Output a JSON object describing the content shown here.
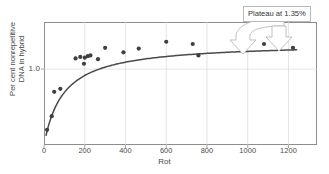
{
  "chart_data": {
    "type": "scatter",
    "title": "",
    "xlabel": "Rot",
    "ylabel_lines": [
      "Per cent nonrepetitive",
      "DNA in hybrid"
    ],
    "xlim": [
      0,
      1340
    ],
    "ylim": [
      0,
      1.62
    ],
    "xticks": [
      0,
      200,
      400,
      600,
      800,
      1000,
      1200
    ],
    "xticklabels": [
      "0",
      "200",
      "400",
      "600",
      "800",
      "1000",
      "1200"
    ],
    "yticks": [
      1.0
    ],
    "yticklabels": [
      "1.0"
    ],
    "grid": true,
    "legend": "none",
    "marker_color": "#3f3f3f",
    "curve_color": "#4a4a4a",
    "grid_color": "#d9d9d9",
    "frame_color": "#8d8d8d",
    "points": [
      {
        "x": 15,
        "y": 0.2
      },
      {
        "x": 38,
        "y": 0.38
      },
      {
        "x": 50,
        "y": 0.7
      },
      {
        "x": 80,
        "y": 0.74
      },
      {
        "x": 155,
        "y": 1.14
      },
      {
        "x": 178,
        "y": 1.16
      },
      {
        "x": 196,
        "y": 1.07
      },
      {
        "x": 200,
        "y": 1.15
      },
      {
        "x": 215,
        "y": 1.17
      },
      {
        "x": 228,
        "y": 1.18
      },
      {
        "x": 265,
        "y": 1.13
      },
      {
        "x": 300,
        "y": 1.28
      },
      {
        "x": 390,
        "y": 1.22
      },
      {
        "x": 465,
        "y": 1.27
      },
      {
        "x": 600,
        "y": 1.36
      },
      {
        "x": 730,
        "y": 1.33
      },
      {
        "x": 758,
        "y": 1.18
      },
      {
        "x": 1080,
        "y": 1.33
      },
      {
        "x": 1222,
        "y": 1.28
      }
    ],
    "fit_curve": {
      "description": "saturating hyperbolic fit rising to plateau",
      "plateau_value": 1.35,
      "x_start": 10,
      "x_end": 1240
    },
    "annotation": {
      "text": "Plateau at 1.35%",
      "arrow": "curved-block-arrow-down",
      "points_to_x": 960,
      "points_to_y": 1.35
    }
  }
}
